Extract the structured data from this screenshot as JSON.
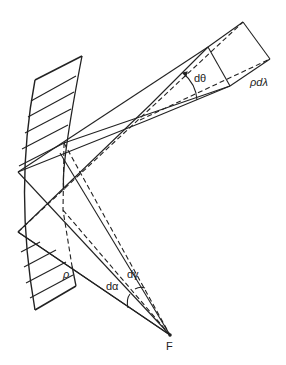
{
  "labels": {
    "d_theta": "dθ",
    "rho_d_lambda": "ρdλ",
    "rho": "ρ",
    "d_alpha": "dα",
    "d_gamma": "dγ",
    "focus": "F"
  },
  "colors": {
    "line": "#222222",
    "background": "#ffffff"
  }
}
